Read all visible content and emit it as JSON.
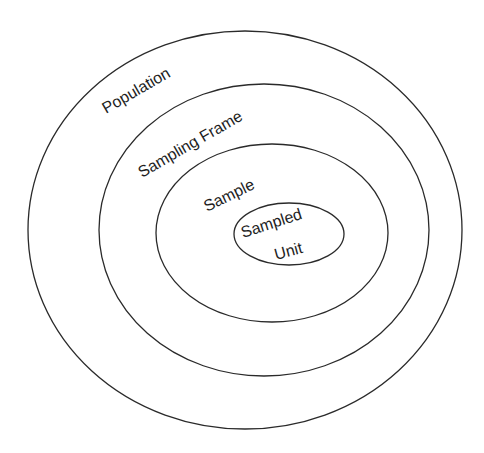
{
  "diagram": {
    "type": "nested-ellipses",
    "line_color": "#2a2a2a",
    "text_color": "#1e1e1e",
    "background": "#ffffff",
    "levels": [
      {
        "label": "Population"
      },
      {
        "label": "Sampling Frame"
      },
      {
        "label": "Sample"
      },
      {
        "label_line1": "Sampled",
        "label_line2": "Unit"
      }
    ]
  }
}
